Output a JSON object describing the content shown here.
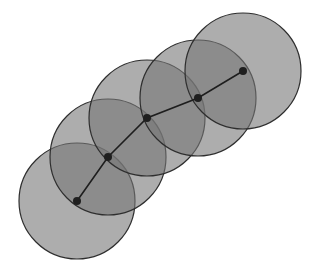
{
  "diagram": {
    "colors": {
      "background": "#ffffff",
      "disc_fill": "#767676",
      "disc_opacity": 0.6,
      "disc_stroke": "#2e2e2e",
      "path_stroke": "#1e1e1e",
      "node_fill": "#1f1f1f"
    },
    "radius": 58,
    "node_radius": 4,
    "points": [
      {
        "id": "p1",
        "x": 77,
        "y": 201
      },
      {
        "id": "p2",
        "x": 108,
        "y": 157
      },
      {
        "id": "p3",
        "x": 147,
        "y": 118
      },
      {
        "id": "p4",
        "x": 198,
        "y": 98
      },
      {
        "id": "p5",
        "x": 243,
        "y": 71
      }
    ]
  }
}
